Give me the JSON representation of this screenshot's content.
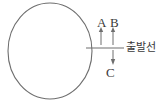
{
  "figure": {
    "name": "circle-with-starting-line-diagram",
    "background_color": "#ffffff",
    "stroke_color": "#6e6e6e",
    "text_color": "#3a3a3a",
    "width": 164,
    "height": 103
  },
  "circle": {
    "name": "large-circle",
    "center_x": 50,
    "center_y": 51,
    "radius_x": 42,
    "radius_y": 48
  },
  "starting_line": {
    "label": "출발선",
    "y": 48,
    "x_start": 86,
    "x_end": 124
  },
  "arrows": [
    {
      "label": "A",
      "direction": "up",
      "x": 101,
      "tail_y": 44,
      "head_y": 29
    },
    {
      "label": "B",
      "direction": "up",
      "x": 113,
      "tail_y": 44,
      "head_y": 29
    },
    {
      "label": "C",
      "direction": "down",
      "x": 113,
      "tail_y": 50,
      "head_y": 64
    }
  ]
}
